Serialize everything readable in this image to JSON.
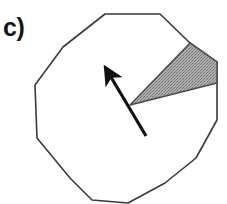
{
  "figure": {
    "panel_label": "c)",
    "caption_visible": false,
    "background_color": "#ffffff",
    "width": 227,
    "height": 204
  },
  "colors": {
    "outline": "#3a3a3a",
    "wedge_fill": "#9b9b9b",
    "wedge_stroke": "#4a4a4a",
    "arrow": "#111111",
    "label_text": "#151515"
  },
  "chart_data": {
    "type": "diagram",
    "title": "c)",
    "shapes": [
      {
        "name": "polygon-outline",
        "kind": "polygon",
        "sides": 12,
        "stroke": "#3a3a3a",
        "stroke_width": 1.6,
        "fill": "none",
        "points": [
          [
            105,
            14
          ],
          [
            160,
            14
          ],
          [
            190,
            43
          ],
          [
            217,
            62
          ],
          [
            217,
            120
          ],
          [
            196,
            158
          ],
          [
            165,
            183
          ],
          [
            128,
            203
          ],
          [
            92,
            200
          ],
          [
            70,
            178
          ],
          [
            37,
            138
          ],
          [
            35,
            85
          ],
          [
            63,
            47
          ]
        ]
      },
      {
        "name": "shaded-sector",
        "kind": "wedge",
        "fill": "#9b9b9b",
        "texture": "stipple",
        "stroke": "#4a4a4a",
        "stroke_width": 1.4,
        "apex": [
          130,
          105
        ],
        "points": [
          [
            130,
            105
          ],
          [
            190,
            43
          ],
          [
            217,
            62
          ],
          [
            217,
            83
          ]
        ]
      },
      {
        "name": "direction-arrow",
        "kind": "arrow",
        "color": "#111111",
        "shaft_width": 3.2,
        "tail": [
          146,
          136
        ],
        "tip": [
          105,
          67
        ],
        "head_length": 22,
        "head_half_width": 8
      }
    ],
    "xlabel": "",
    "ylabel": "",
    "grid": false,
    "legend": null
  }
}
